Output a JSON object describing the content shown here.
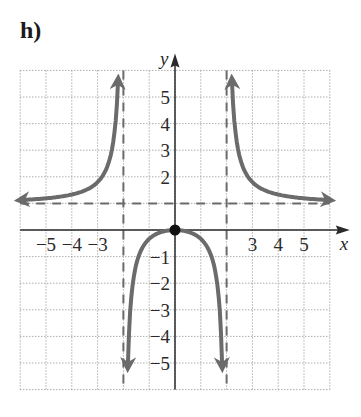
{
  "part_label": "h)",
  "chart_data": {
    "type": "line",
    "title": "",
    "xlabel": "x",
    "ylabel": "y",
    "xlim": [
      -6,
      6
    ],
    "ylim": [
      -6,
      6
    ],
    "grid": true,
    "x_tick_labels": [
      "−5",
      "−4",
      "−3",
      "3",
      "4",
      "5"
    ],
    "x_ticks": [
      -5,
      -4,
      -3,
      3,
      4,
      5
    ],
    "y_tick_labels": [
      "5",
      "4",
      "3",
      "2",
      "−1",
      "−2",
      "−3",
      "−4",
      "−5"
    ],
    "y_ticks": [
      5,
      4,
      3,
      2,
      -1,
      -2,
      -3,
      -4,
      -5
    ],
    "asymptotes": {
      "vertical": [
        -2,
        2
      ],
      "horizontal": [
        1
      ]
    },
    "function_description": "Rational function y = x^2/(x^2 - 4) with vertical asymptotes x = -2, x = 2 and horizontal asymptote y = 1",
    "points": [
      {
        "x": 0,
        "y": 0,
        "label": "local maximum / intercept",
        "marker": "filled-circle"
      }
    ],
    "series": [
      {
        "name": "left branch",
        "x": [
          -6,
          -5,
          -4,
          -3,
          -2.5,
          -2.3,
          -2.2
        ],
        "y": [
          1.13,
          1.19,
          1.33,
          1.8,
          2.78,
          4.1,
          5.76
        ]
      },
      {
        "name": "middle branch",
        "x": [
          -1.85,
          -1.5,
          -1,
          -0.5,
          0,
          0.5,
          1,
          1.5,
          1.85
        ],
        "y": [
          -5.9,
          -1.29,
          -0.33,
          -0.07,
          0,
          -0.07,
          -0.33,
          -1.29,
          -5.9
        ]
      },
      {
        "name": "right branch",
        "x": [
          2.2,
          2.3,
          2.5,
          3,
          4,
          5,
          6
        ],
        "y": [
          5.76,
          4.1,
          2.78,
          1.8,
          1.33,
          1.19,
          1.13
        ]
      }
    ],
    "colors": {
      "curve": "#6b6b6b",
      "asymptote": "#6b6b6b",
      "grid": "#9a9a9a",
      "axis": "#2a2a2a",
      "point": "#111111"
    }
  }
}
